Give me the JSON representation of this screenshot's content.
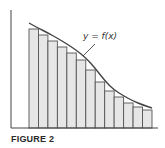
{
  "figure": {
    "caption": "FIGURE 2",
    "curve_label": "y = f(x)"
  },
  "diagram": {
    "type": "lower Riemann sum (inscribed rectangles under decreasing curve)",
    "axes": {
      "origin": [
        11,
        128
      ],
      "y_top": 10,
      "x_right": 158
    },
    "rectangles": {
      "count": 13,
      "x_start": 29,
      "x_end": 152,
      "tops": [
        29,
        35,
        41,
        47,
        53,
        60,
        70,
        82,
        91,
        97,
        103,
        107,
        110
      ],
      "fill": "#e6e6e6",
      "stroke": "#555555"
    },
    "curve_points": [
      [
        29,
        23
      ],
      [
        38,
        28
      ],
      [
        48,
        33
      ],
      [
        57,
        38
      ],
      [
        67,
        44
      ],
      [
        76,
        50
      ],
      [
        86,
        58
      ],
      [
        95,
        68
      ],
      [
        105,
        81
      ],
      [
        114,
        90
      ],
      [
        124,
        96
      ],
      [
        133,
        101
      ],
      [
        143,
        105
      ],
      [
        152,
        108
      ]
    ]
  }
}
